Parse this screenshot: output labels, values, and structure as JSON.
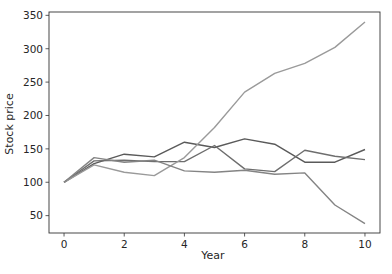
{
  "chart_data": {
    "type": "line",
    "title": "",
    "xlabel": "Year",
    "ylabel": "Stock price",
    "x": [
      0,
      1,
      2,
      3,
      4,
      5,
      6,
      7,
      8,
      9,
      10
    ],
    "xlim": [
      -0.5,
      10.5
    ],
    "ylim": [
      24,
      355
    ],
    "xticks": [
      0,
      2,
      4,
      6,
      8,
      10
    ],
    "yticks": [
      50,
      100,
      150,
      200,
      250,
      300,
      350
    ],
    "grid": false,
    "legend": null,
    "series": [
      {
        "name": "Stock A",
        "color": "#5a5a5a",
        "values": [
          100,
          128,
          142,
          138,
          160,
          152,
          165,
          157,
          130,
          130,
          149
        ]
      },
      {
        "name": "Stock B",
        "color": "#6e6e6e",
        "values": [
          100,
          132,
          133,
          131,
          131,
          155,
          120,
          116,
          148,
          139,
          134
        ]
      },
      {
        "name": "Stock C",
        "color": "#9a9a9a",
        "values": [
          100,
          126,
          115,
          110,
          137,
          182,
          235,
          263,
          278,
          302,
          340
        ]
      },
      {
        "name": "Stock D",
        "color": "#848484",
        "values": [
          100,
          137,
          130,
          133,
          117,
          115,
          118,
          112,
          114,
          66,
          38
        ]
      }
    ]
  }
}
